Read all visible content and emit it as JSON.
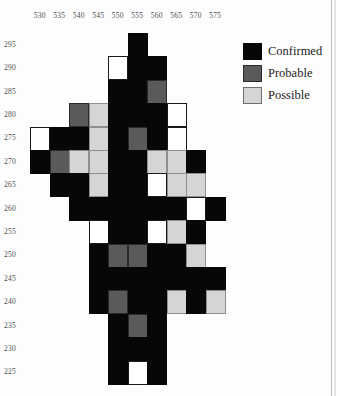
{
  "figure": {
    "kind": "spot-map",
    "background": "#ffffff"
  },
  "legend": {
    "position": "top-right",
    "items": [
      {
        "label": "Confirmed",
        "key": "confirmed",
        "color": "#070707",
        "swatch_name": "legend-swatch-confirmed"
      },
      {
        "label": "Probable",
        "key": "probable",
        "color": "#5a5a5a",
        "swatch_name": "legend-swatch-probable"
      },
      {
        "label": "Possible",
        "key": "possible",
        "color": "#d5d5d5",
        "swatch_name": "legend-swatch-possible"
      }
    ]
  },
  "chart_data": {
    "type": "heatmap",
    "title": "",
    "xlabel": "",
    "ylabel": "",
    "grid": false,
    "legend_position": "top-right",
    "x_ticks": [
      530,
      535,
      540,
      545,
      550,
      555,
      560,
      565,
      570,
      575
    ],
    "y_ticks": [
      295,
      290,
      285,
      280,
      275,
      270,
      265,
      260,
      255,
      250,
      245,
      240,
      235,
      230,
      225
    ],
    "xlim": [
      527.5,
      577.5
    ],
    "ylim": [
      222.5,
      297.5
    ],
    "cell_size": {
      "x": 5,
      "y": 5
    },
    "categories_x": [
      "530",
      "535",
      "540",
      "545",
      "550",
      "555",
      "560",
      "565",
      "570",
      "575"
    ],
    "categories_y": [
      "295",
      "290",
      "285",
      "280",
      "275",
      "270",
      "265",
      "260",
      "255",
      "250",
      "245",
      "240",
      "235",
      "230",
      "225"
    ],
    "value_legend": {
      "0": "empty",
      "1": "confirmed",
      "2": "probable",
      "3": "possible",
      "4": "none"
    },
    "cell_colors": {
      "empty": "transparent",
      "confirmed": "#070707",
      "probable": "#5a5a5a",
      "possible": "#d5d5d5",
      "none": "#ffffff"
    },
    "matrix": [
      [
        0,
        0,
        0,
        0,
        0,
        1,
        0,
        0,
        0,
        0
      ],
      [
        0,
        0,
        0,
        0,
        4,
        1,
        1,
        0,
        0,
        0
      ],
      [
        0,
        0,
        0,
        0,
        1,
        1,
        2,
        0,
        0,
        0
      ],
      [
        0,
        0,
        2,
        3,
        1,
        1,
        1,
        4,
        0,
        0
      ],
      [
        4,
        1,
        1,
        3,
        1,
        2,
        1,
        4,
        0,
        0
      ],
      [
        1,
        2,
        3,
        3,
        1,
        1,
        3,
        3,
        1,
        0
      ],
      [
        0,
        1,
        1,
        3,
        1,
        1,
        4,
        3,
        3,
        0
      ],
      [
        0,
        0,
        1,
        1,
        1,
        1,
        1,
        1,
        4,
        1
      ],
      [
        0,
        0,
        0,
        4,
        1,
        1,
        4,
        3,
        1,
        0
      ],
      [
        0,
        0,
        0,
        1,
        2,
        2,
        1,
        1,
        3,
        0
      ],
      [
        0,
        0,
        0,
        1,
        1,
        1,
        1,
        1,
        1,
        1
      ],
      [
        0,
        0,
        0,
        1,
        2,
        1,
        1,
        3,
        1,
        3
      ],
      [
        0,
        0,
        0,
        0,
        1,
        2,
        1,
        0,
        0,
        0
      ],
      [
        0,
        0,
        0,
        0,
        1,
        1,
        1,
        0,
        0,
        0
      ],
      [
        0,
        0,
        0,
        0,
        1,
        4,
        1,
        0,
        0,
        0
      ]
    ],
    "counts": {
      "confirmed": 72,
      "probable": 9,
      "possible": 14,
      "none": 9
    }
  },
  "layout": {
    "grid_left": 30,
    "grid_top": 33,
    "cell_w": 19.5,
    "cell_h": 23.4
  }
}
